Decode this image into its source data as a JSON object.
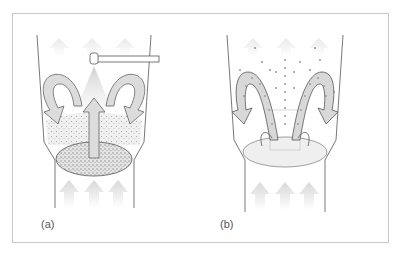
{
  "figure": {
    "panels": [
      {
        "id": "a",
        "label": "(a)",
        "description": "spray nozzle above fluidized bed with circulating airflow arrows"
      },
      {
        "id": "b",
        "label": "(b)",
        "description": "particle circulation pattern with dotted flow paths"
      }
    ],
    "colors": {
      "frame": "#c8c8c8",
      "vessel_line": "#555555",
      "arrow_fill": "#d9d9d9",
      "arrow_stroke": "#666666",
      "air_arrow": "#e2e2e2",
      "particle_dot": "#888888"
    }
  }
}
